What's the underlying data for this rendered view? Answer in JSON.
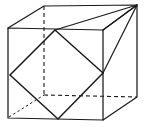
{
  "figure": {
    "kind": "geometry-line-drawing",
    "width": 145,
    "height": 132,
    "background_color": "#ffffff",
    "line_color": "#1a1a1a",
    "projection": "oblique / parallel projection",
    "caption": "",
    "labels": [],
    "vertices": {
      "front_top_left": [
        8,
        28
      ],
      "front_top_right": [
        103,
        30
      ],
      "front_bottom_left": [
        8,
        118
      ],
      "front_bottom_right": [
        103,
        120
      ],
      "back_top_left": [
        44,
        6
      ],
      "back_top_right": [
        137,
        5
      ],
      "back_bottom_left": [
        44,
        95
      ],
      "back_bottom_right": [
        137,
        97
      ]
    },
    "inscribed_square": {
      "top": [
        55,
        30
      ],
      "right": [
        103,
        73
      ],
      "bottom": [
        58,
        119
      ],
      "left": [
        10,
        75
      ],
      "visible": true
    },
    "triangle_top": {
      "apex": [
        137,
        5
      ],
      "base_left": [
        55,
        30
      ],
      "base_right": [
        103,
        30
      ]
    },
    "hidden_edges": [
      "back-top-left to back-bottom-left (vertical dashed)",
      "back-bottom-left to back-bottom-right (horizontal dashed)",
      "front-bottom-left to back-bottom-left (diagonal dashed)"
    ],
    "solid_paths": {
      "front_face": "8,28 103,30 103,120 8,118",
      "top_face": "8,28 44,6 137,5 103,30",
      "right_face": "103,30 137,5 137,97 103,120"
    }
  }
}
